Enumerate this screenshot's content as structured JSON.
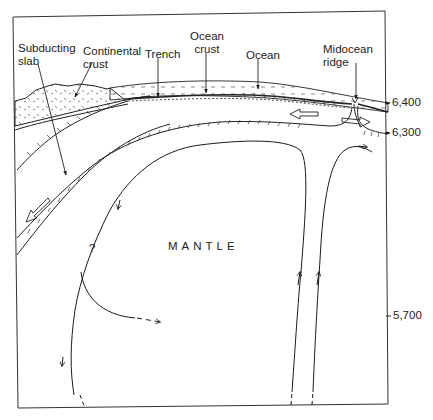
{
  "diagram": {
    "title": "",
    "labels": {
      "subducting_slab": "Subducting\nslab",
      "continental_crust": "Continental\ncrust",
      "trench": "Trench",
      "ocean_crust": "Ocean\ncrust",
      "ocean": "Ocean",
      "midocean_ridge": "Midocean\nridge",
      "mantle": "MANTLE",
      "question": "?"
    },
    "radius_ticks": [
      {
        "value": "6,400",
        "y": 103
      },
      {
        "value": "6,300",
        "y": 133
      },
      {
        "value": "5,700",
        "y": 316
      }
    ],
    "colors": {
      "line": "#1a1a1a",
      "background": "#ffffff"
    }
  }
}
